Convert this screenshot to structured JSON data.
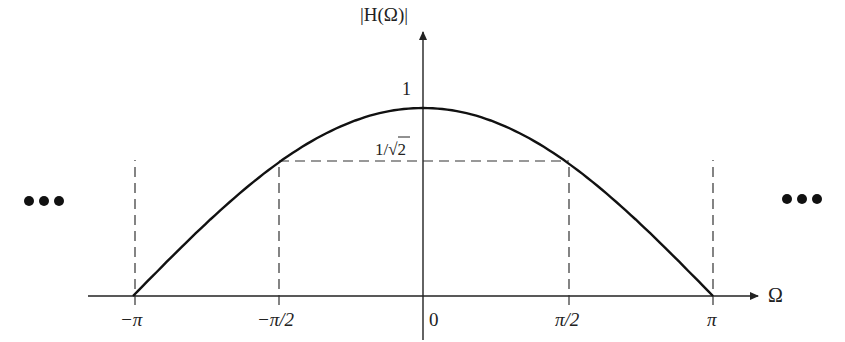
{
  "chart_data": {
    "type": "line",
    "title": "",
    "xlabel": "Ω",
    "ylabel": "|H(Ω)|",
    "function": "cos(Ω/2)",
    "x_ticks": [
      "−π",
      "−π/2",
      "0",
      "π/2",
      "π"
    ],
    "x_tick_values": [
      -3.1416,
      -1.5708,
      0,
      1.5708,
      3.1416
    ],
    "y_ticks": [
      "1",
      "1/√2"
    ],
    "y_tick_values": [
      1,
      0.7071
    ],
    "x": [
      -3.1416,
      -1.5708,
      0,
      1.5708,
      3.1416
    ],
    "values": [
      0,
      0.7071,
      1,
      0.7071,
      0
    ],
    "xlim": [
      -3.1416,
      3.1416
    ],
    "ylim": [
      0,
      1
    ],
    "annotations": [
      "dashed vertical lines at Ω = ±π and ±π/2",
      "dashed horizontal line at 1/√2",
      "… periodic continuation on both sides"
    ],
    "grid": false
  },
  "labels": {
    "y_axis": "|H(Ω)|",
    "x_axis": "Ω",
    "one": "1",
    "inv_sqrt2_prefix": "1/",
    "inv_sqrt2_root": "√2",
    "neg_pi": "−π",
    "neg_pi_half": "−π/2",
    "zero": "0",
    "pi_half": "π/2",
    "pi": "π",
    "ellipsis_left": "•••",
    "ellipsis_right": "•••"
  },
  "colors": {
    "curve": "#111111",
    "axis": "#222222",
    "dash": "#333333"
  }
}
